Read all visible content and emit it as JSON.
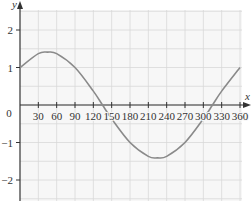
{
  "chart_data": {
    "type": "line",
    "title": "",
    "xlabel": "x",
    "ylabel": "y",
    "xlim": [
      0,
      360
    ],
    "ylim": [
      -2.5,
      2.5
    ],
    "x_ticks": [
      30,
      60,
      90,
      120,
      150,
      180,
      210,
      240,
      270,
      300,
      330,
      360
    ],
    "x_tick_labels": [
      "30",
      "60",
      "90",
      "120",
      "150",
      "180",
      "210",
      "240",
      "270",
      "300",
      "330",
      "360"
    ],
    "y_ticks": [
      2,
      1,
      0,
      -1,
      -2
    ],
    "y_tick_labels": [
      "2",
      "1",
      "0",
      "−1",
      "−2"
    ],
    "origin_label": "0",
    "grid": true,
    "series": [
      {
        "name": "curve",
        "x": [
          0,
          30,
          45,
          60,
          90,
          120,
          135,
          150,
          180,
          210,
          225,
          240,
          270,
          300,
          315,
          330,
          360
        ],
        "values": [
          1,
          1.37,
          1.41,
          1.37,
          1,
          0.37,
          0,
          -0.37,
          -1,
          -1.37,
          -1.41,
          -1.37,
          -1,
          -0.37,
          0,
          0.37,
          1
        ]
      }
    ],
    "colors": {
      "grid": "#d8d8d8",
      "axis": "#333333",
      "curve": "#8a8a8a",
      "background": "#f7f7f7"
    }
  }
}
